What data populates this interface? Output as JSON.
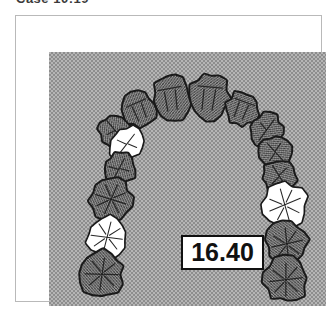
{
  "title": "Case 10:19",
  "panel": {
    "background_color": "#b5b5b5",
    "halftone_color": "#8d8d8d"
  },
  "frame": {
    "border_color": "#b9b9b9"
  },
  "measurement": {
    "value": "16.40",
    "box_border_color": "#111111",
    "box_fill_color": "#ffffff"
  },
  "arch": {
    "type": "dental-arch-occlusal-diagram",
    "arch_form": "U-shaped maxillary arch, anterior teeth at top",
    "outline_color": "#1a1a1a",
    "shaded_tooth_fill": "#9a9a9a",
    "highlighted_tooth_fill": "#ffffff",
    "tooth_count": 14,
    "highlighted_count": 3,
    "teeth": [
      {
        "id": "UL-central-incisor",
        "position": "anterior-left",
        "cx": 122,
        "cy": 46,
        "rx": 19,
        "ry": 23,
        "rot": -8,
        "state": "shaded",
        "fissure": "incisor"
      },
      {
        "id": "UR-central-incisor",
        "position": "anterior-right",
        "cx": 160,
        "cy": 45,
        "rx": 20,
        "ry": 24,
        "rot": 8,
        "state": "shaded",
        "fissure": "incisor"
      },
      {
        "id": "UL-lateral-incisor",
        "position": "antero-left",
        "cx": 90,
        "cy": 58,
        "rx": 17,
        "ry": 18,
        "rot": -22,
        "state": "shaded",
        "fissure": "incisor"
      },
      {
        "id": "UR-lateral-incisor",
        "position": "antero-right",
        "cx": 193,
        "cy": 57,
        "rx": 17,
        "ry": 18,
        "rot": 22,
        "state": "shaded",
        "fissure": "incisor"
      },
      {
        "id": "UL-canine",
        "position": "left-canine",
        "cx": 66,
        "cy": 79,
        "rx": 16,
        "ry": 17,
        "rot": -38,
        "state": "shaded",
        "fissure": "canine"
      },
      {
        "id": "UR-canine",
        "position": "right-canine",
        "cx": 217,
        "cy": 78,
        "rx": 16,
        "ry": 17,
        "rot": 38,
        "state": "shaded",
        "fissure": "canine"
      },
      {
        "id": "UL-first-premolar",
        "position": "left-first-premolar",
        "cx": 78,
        "cy": 92,
        "rx": 18,
        "ry": 16,
        "rot": -50,
        "state": "highlighted",
        "fissure": "premolar"
      },
      {
        "id": "UR-first-premolar",
        "position": "right-first-premolar",
        "cx": 226,
        "cy": 100,
        "rx": 16,
        "ry": 16,
        "rot": 50,
        "state": "shaded",
        "fissure": "premolar"
      },
      {
        "id": "UL-second-premolar",
        "position": "left-second-premolar",
        "cx": 70,
        "cy": 117,
        "rx": 17,
        "ry": 16,
        "rot": -60,
        "state": "shaded",
        "fissure": "premolar"
      },
      {
        "id": "UR-second-premolar",
        "position": "right-second-premolar",
        "cx": 230,
        "cy": 124,
        "rx": 17,
        "ry": 17,
        "rot": 60,
        "state": "shaded",
        "fissure": "premolar"
      },
      {
        "id": "UL-first-molar",
        "position": "left-first-molar",
        "cx": 62,
        "cy": 147,
        "rx": 22,
        "ry": 21,
        "rot": -70,
        "state": "shaded",
        "fissure": "molar"
      },
      {
        "id": "UR-first-molar",
        "position": "right-first-molar",
        "cx": 236,
        "cy": 153,
        "rx": 23,
        "ry": 22,
        "rot": 70,
        "state": "highlighted",
        "fissure": "molar"
      },
      {
        "id": "UL-second-molar",
        "position": "left-second-molar",
        "cx": 58,
        "cy": 185,
        "rx": 22,
        "ry": 21,
        "rot": -80,
        "state": "highlighted",
        "fissure": "molar"
      },
      {
        "id": "UR-second-molar",
        "position": "right-second-molar",
        "cx": 238,
        "cy": 192,
        "rx": 22,
        "ry": 21,
        "rot": 80,
        "state": "shaded",
        "fissure": "molar"
      },
      {
        "id": "UL-third-molar",
        "position": "left-third-molar",
        "cx": 53,
        "cy": 222,
        "rx": 23,
        "ry": 22,
        "rot": -86,
        "state": "shaded",
        "fissure": "molar"
      },
      {
        "id": "UR-third-molar",
        "position": "right-third-molar",
        "cx": 237,
        "cy": 228,
        "rx": 23,
        "ry": 22,
        "rot": 86,
        "state": "shaded",
        "fissure": "molar"
      }
    ]
  }
}
